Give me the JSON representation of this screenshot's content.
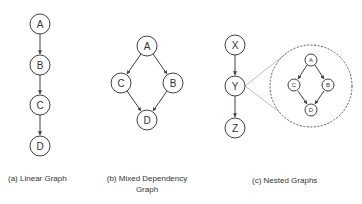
{
  "panels": [
    {
      "id": "a",
      "caption": "(a) Linear Graph",
      "nodes": [
        {
          "label": "A",
          "x": 40,
          "y": 24
        },
        {
          "label": "B",
          "x": 40,
          "y": 65
        },
        {
          "label": "C",
          "x": 40,
          "y": 105
        },
        {
          "label": "D",
          "x": 40,
          "y": 146
        }
      ],
      "edges": [
        [
          "A",
          "B"
        ],
        [
          "B",
          "C"
        ],
        [
          "C",
          "D"
        ]
      ]
    },
    {
      "id": "b",
      "caption_line1": "(b) Mixed Dependency",
      "caption_line2": "Graph",
      "nodes": [
        {
          "label": "A",
          "x": 147,
          "y": 46
        },
        {
          "label": "C",
          "x": 121,
          "y": 83
        },
        {
          "label": "B",
          "x": 173,
          "y": 83
        },
        {
          "label": "D",
          "x": 147,
          "y": 120
        }
      ],
      "edges": [
        [
          "A",
          "C"
        ],
        [
          "A",
          "B"
        ],
        [
          "C",
          "D"
        ],
        [
          "B",
          "D"
        ]
      ]
    },
    {
      "id": "c",
      "caption": "(c) Nested Graphs",
      "nodes": [
        {
          "label": "X",
          "x": 235,
          "y": 45
        },
        {
          "label": "Y",
          "x": 235,
          "y": 86
        },
        {
          "label": "Z",
          "x": 235,
          "y": 128
        }
      ],
      "edges": [
        [
          "X",
          "Y"
        ],
        [
          "Y",
          "Z"
        ]
      ],
      "nested": {
        "expands_node": "Y",
        "nodes": [
          {
            "label": "A",
            "x": 311,
            "y": 60
          },
          {
            "label": "C",
            "x": 294,
            "y": 85
          },
          {
            "label": "B",
            "x": 328,
            "y": 85
          },
          {
            "label": "D",
            "x": 311,
            "y": 110
          }
        ],
        "edges": [
          [
            "A",
            "C"
          ],
          [
            "A",
            "B"
          ],
          [
            "C",
            "D"
          ],
          [
            "B",
            "D"
          ]
        ]
      }
    }
  ]
}
